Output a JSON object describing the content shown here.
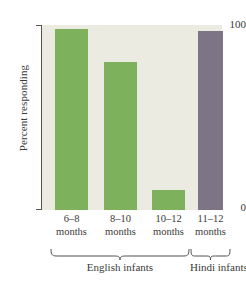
{
  "chart_data": {
    "type": "bar",
    "title": "",
    "xlabel": "",
    "ylabel": "Percent responding",
    "ylim": [
      0,
      100
    ],
    "yticks": [
      0,
      100
    ],
    "ytick_labels": [
      "0",
      "100"
    ],
    "grid": false,
    "legend": "none",
    "categories": [
      "6–8 months",
      "8–10 months",
      "10–12 months",
      "11–12 months"
    ],
    "values": [
      98,
      80,
      11,
      97
    ],
    "bars": [
      {
        "label_line1": "6–8",
        "label_line2": "months",
        "value": 98,
        "color": "#7eb15c",
        "group": "English infants"
      },
      {
        "label_line1": "8–10",
        "label_line2": "months",
        "value": 80,
        "color": "#7eb15c",
        "group": "English infants"
      },
      {
        "label_line1": "10–12",
        "label_line2": "months",
        "value": 11,
        "color": "#7eb15c",
        "group": "English infants"
      },
      {
        "label_line1": "11–12",
        "label_line2": "months",
        "value": 97,
        "color": "#7d7486",
        "group": "Hindi infants"
      }
    ],
    "groups": [
      {
        "name": "English infants",
        "bar_count": 3
      },
      {
        "name": "Hindi infants",
        "bar_count": 1
      }
    ],
    "colors": {
      "english_bar": "#7eb15c",
      "hindi_bar": "#7d7486",
      "panel_background": "#ecebe1",
      "axis": "#55524d",
      "text": "#3a3a38",
      "page_background": "#ffffff"
    }
  }
}
